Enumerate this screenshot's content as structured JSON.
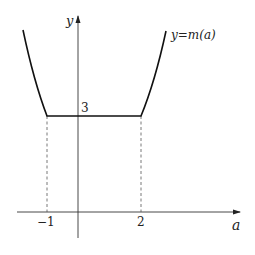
{
  "diagram": {
    "axis_x_label": "a",
    "axis_y_label": "y",
    "curve_label": "y=m(a)",
    "tick_x_neg": "−1",
    "tick_x_pos": "2",
    "tick_y": "3",
    "colors": {
      "curve": "#111111",
      "axis": "#333333",
      "dashed": "#555555"
    }
  }
}
